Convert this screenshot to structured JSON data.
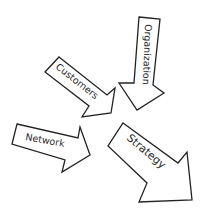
{
  "diagram": {
    "type": "converging-arrows",
    "arrows": [
      {
        "label": "Organization",
        "direction": "down"
      },
      {
        "label": "Customers",
        "direction": "down-right"
      },
      {
        "label": "Network",
        "direction": "right"
      },
      {
        "label": "Strategy",
        "direction": "down-right"
      }
    ]
  },
  "colors": {
    "stroke": "#222222",
    "fill": "#ffffff",
    "text": "#2a2a2a"
  }
}
